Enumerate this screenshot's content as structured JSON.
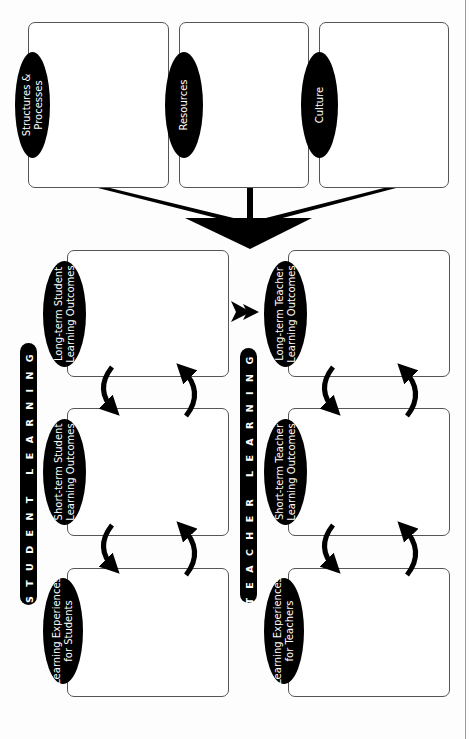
{
  "diagram": {
    "orientation": "rotated-90-ccw",
    "colors": {
      "fill": "#000000",
      "box_border": "#555555",
      "text_on_dark": "#ffffff",
      "edge_line": "#9a9a9a"
    },
    "context_factors": [
      {
        "label": "Structures & Processes",
        "line1": "Structures &",
        "line2": "Processes"
      },
      {
        "label": "Resources",
        "line1": "Resources",
        "line2": ""
      },
      {
        "label": "Culture",
        "line1": "Culture",
        "line2": ""
      }
    ],
    "student_learning": {
      "title": "STUDENT LEARNING",
      "boxes": [
        {
          "label": "Long-term Student Learning Outcomes",
          "line1": "Long-term Student",
          "line2": "Learning Outcomes"
        },
        {
          "label": "Short-term Student Learning Outcomes",
          "line1": "Short-term Student",
          "line2": "Learning Outcomes"
        },
        {
          "label": "Learning Experiences for Students",
          "line1": "Learning Experiences",
          "line2": "for Students"
        }
      ]
    },
    "teacher_learning": {
      "title": "TEACHER LEARNING",
      "boxes": [
        {
          "label": "Long-term Teacher Learning Outcomes",
          "line1": "Long-term Teacher",
          "line2": "Learning Outcomes"
        },
        {
          "label": "Short-term Teacher Learning Outcomes",
          "line1": "Short-term Teacher",
          "line2": "Learning Outcomes"
        },
        {
          "label": "Learning Experiences for Teachers",
          "line1": "Learning Experiences",
          "line2": "for Teachers"
        }
      ]
    },
    "connectors": [
      "context-factors converge into large arrow pointing to learning outcomes",
      "double arrowhead from student long-term outcomes to teacher long-term outcomes",
      "bidirectional curved arrows between adjacent boxes in each column"
    ]
  }
}
